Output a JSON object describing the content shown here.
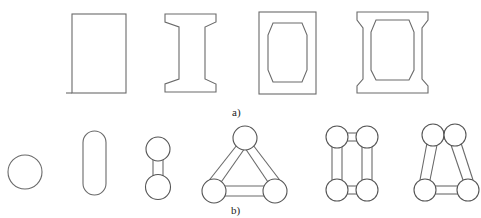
{
  "figure": {
    "panel_a": {
      "label": "a)",
      "shapes": [
        {
          "name": "solid-rectangular-section"
        },
        {
          "name": "i-beam-section"
        },
        {
          "name": "box-section-octagonal-void"
        },
        {
          "name": "i-box-section-octagonal-void"
        }
      ]
    },
    "panel_b": {
      "label": "b)",
      "shapes": [
        {
          "name": "circular-column"
        },
        {
          "name": "oblong-column"
        },
        {
          "name": "two-column-dumbbell"
        },
        {
          "name": "three-column-triangle"
        },
        {
          "name": "four-column-rectangle"
        },
        {
          "name": "four-column-trapezoid"
        }
      ]
    },
    "colors": {
      "line": "#6a6a6a",
      "background": "#ffffff",
      "text": "#222222"
    }
  }
}
